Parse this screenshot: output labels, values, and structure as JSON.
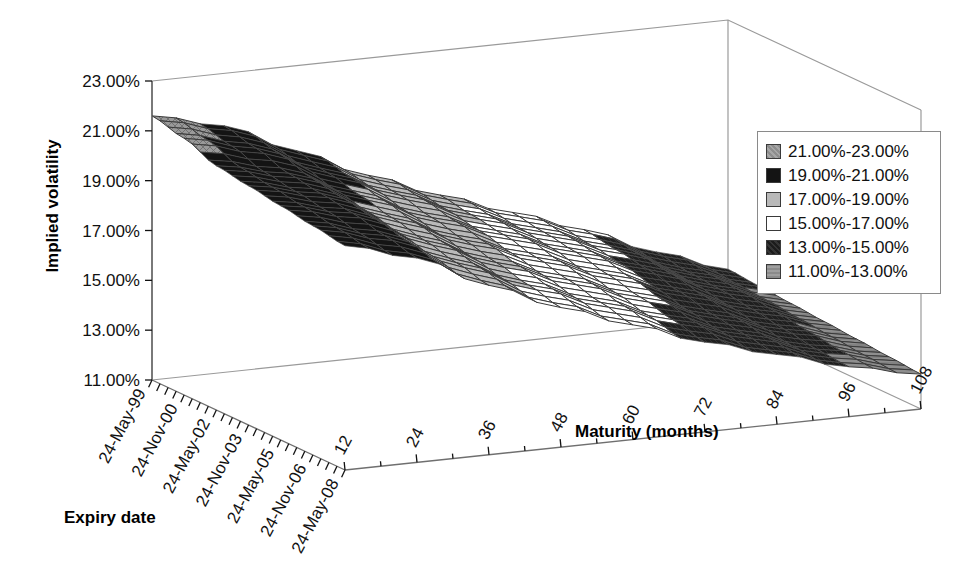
{
  "chart_data": {
    "type": "surface",
    "title": "",
    "xlabel": "Expiry date",
    "ylabel": "Maturity (months)",
    "zlabel": "Implied volatility",
    "z_ticks": [
      "23.00%",
      "21.00%",
      "19.00%",
      "17.00%",
      "15.00%",
      "13.00%",
      "11.00%"
    ],
    "zlim": [
      11,
      23
    ],
    "x_categories": [
      "24-May-99",
      "24-Nov-00",
      "24-May-02",
      "24-Nov-03",
      "24-May-05",
      "24-Nov-06",
      "24-May-08"
    ],
    "x_tick_count": 25,
    "y_categories": [
      "12",
      "24",
      "36",
      "48",
      "60",
      "72",
      "84",
      "96",
      "108"
    ],
    "grid": false,
    "legend_position": "right",
    "bands": [
      {
        "label": "21.00%-23.00%",
        "lo": 21,
        "hi": 23,
        "color": "#909090",
        "pattern": "grid-dense"
      },
      {
        "label": "19.00%-21.00%",
        "lo": 19,
        "hi": 21,
        "color": "#141414",
        "pattern": "solid-dark"
      },
      {
        "label": "17.00%-19.00%",
        "lo": 17,
        "hi": 19,
        "color": "#b9b9b9",
        "pattern": "light"
      },
      {
        "label": "15.00%-17.00%",
        "lo": 15,
        "hi": 17,
        "color": "#ffffff",
        "pattern": "white"
      },
      {
        "label": "13.00%-15.00%",
        "lo": 13,
        "hi": 15,
        "color": "#2b2b2b",
        "pattern": "dark"
      },
      {
        "label": "11.00%-13.00%",
        "lo": 11,
        "hi": 13,
        "color": "#8e8e8e",
        "pattern": "mid"
      }
    ],
    "series_note": "implied volatility (%) rows = expiry date index, cols = maturity months",
    "maturities": [
      12,
      24,
      36,
      48,
      60,
      72,
      84,
      96,
      108
    ],
    "expiries": [
      "24-May-99",
      "24-Nov-00",
      "24-May-02",
      "24-Nov-03",
      "24-May-05",
      "24-Nov-06",
      "24-May-08"
    ],
    "values": [
      [
        21.6,
        20.9,
        19.6,
        18.3,
        17.2,
        16.2,
        15.2,
        14.0,
        13.0
      ],
      [
        21.3,
        20.6,
        19.3,
        18.1,
        17.0,
        16.0,
        15.0,
        13.8,
        12.9
      ],
      [
        20.8,
        20.2,
        19.0,
        17.8,
        16.8,
        15.8,
        14.8,
        13.7,
        12.8
      ],
      [
        20.6,
        20.0,
        18.7,
        17.5,
        16.5,
        15.5,
        14.5,
        13.5,
        12.7
      ],
      [
        20.4,
        19.8,
        18.4,
        17.2,
        16.2,
        15.2,
        14.2,
        13.3,
        12.6
      ],
      [
        20.2,
        19.5,
        18.1,
        16.9,
        15.9,
        14.9,
        14.0,
        13.1,
        12.5
      ],
      [
        20.0,
        19.2,
        17.8,
        16.6,
        15.6,
        14.6,
        13.8,
        13.0,
        12.4
      ]
    ]
  },
  "legend": {
    "items": [
      "21.00%-23.00%",
      "19.00%-21.00%",
      "17.00%-19.00%",
      "15.00%-17.00%",
      "13.00%-15.00%",
      "11.00%-13.00%"
    ]
  },
  "axes": {
    "z_title": "Implied volatility",
    "x_title": "Expiry date",
    "y_title": "Maturity (months)",
    "z_ticks": [
      "23.00%",
      "21.00%",
      "19.00%",
      "17.00%",
      "15.00%",
      "13.00%",
      "11.00%"
    ],
    "x_ticks": [
      "24-May-99",
      "24-Nov-00",
      "24-May-02",
      "24-Nov-03",
      "24-May-05",
      "24-Nov-06",
      "24-May-08"
    ],
    "y_ticks": [
      "12",
      "24",
      "36",
      "48",
      "60",
      "72",
      "84",
      "96",
      "108"
    ]
  }
}
